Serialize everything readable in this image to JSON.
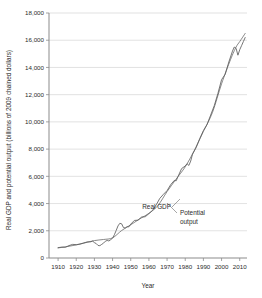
{
  "chart_data": {
    "type": "line",
    "title": "",
    "xlabel": "Year",
    "ylabel": "Real GDP and potential output (billions of 2009 chained dollars)",
    "xlim": [
      1905,
      2014
    ],
    "ylim": [
      0,
      18000
    ],
    "grid": true,
    "legend_position": "inline-annotations",
    "y_ticks": [
      0,
      2000,
      4000,
      6000,
      8000,
      10000,
      12000,
      14000,
      16000,
      18000
    ],
    "y_tick_labels": [
      "0",
      "2,000",
      "4,000",
      "6,000",
      "8,000",
      "10,000",
      "12,000",
      "14,000",
      "16,000",
      "18,000"
    ],
    "x_ticks": [
      1910,
      1920,
      1930,
      1940,
      1950,
      1960,
      1970,
      1980,
      1990,
      2000,
      2010
    ],
    "x_tick_labels": [
      "1910",
      "1920",
      "1930",
      "1940",
      "1950",
      "1960",
      "1970",
      "1980",
      "1990",
      "2000",
      "2010"
    ],
    "annotations": [
      {
        "label": "Real GDP",
        "x": 1963,
        "y": 4150
      },
      {
        "label": "Potential",
        "x": 1978,
        "y": 3450
      },
      {
        "label": "output",
        "x": 1978,
        "y": 2750
      }
    ],
    "series": [
      {
        "name": "Real GDP",
        "x": [
          1910,
          1912,
          1914,
          1916,
          1918,
          1920,
          1922,
          1924,
          1926,
          1928,
          1929,
          1930,
          1931,
          1932,
          1933,
          1934,
          1935,
          1936,
          1937,
          1938,
          1939,
          1940,
          1941,
          1942,
          1943,
          1944,
          1945,
          1946,
          1947,
          1948,
          1949,
          1950,
          1952,
          1954,
          1956,
          1958,
          1960,
          1962,
          1964,
          1966,
          1968,
          1970,
          1972,
          1974,
          1975,
          1976,
          1978,
          1980,
          1981,
          1982,
          1983,
          1984,
          1986,
          1988,
          1990,
          1992,
          1994,
          1996,
          1998,
          2000,
          2002,
          2004,
          2006,
          2007,
          2008,
          2009,
          2010,
          2011,
          2012,
          2013
        ],
        "values": [
          760,
          800,
          790,
          910,
          1000,
          980,
          1020,
          1100,
          1180,
          1190,
          1240,
          1130,
          1060,
          920,
          905,
          1000,
          1090,
          1230,
          1290,
          1250,
          1350,
          1460,
          1710,
          2030,
          2360,
          2550,
          2510,
          2230,
          2210,
          2300,
          2290,
          2490,
          2760,
          2780,
          3010,
          3030,
          3260,
          3500,
          3900,
          4380,
          4680,
          4950,
          5390,
          5700,
          5670,
          5980,
          6570,
          6760,
          6930,
          6800,
          7120,
          7630,
          8110,
          8780,
          9360,
          9800,
          10500,
          11200,
          12100,
          13100,
          13500,
          14400,
          15200,
          15500,
          15400,
          14900,
          15300,
          15600,
          15900,
          16200
        ]
      },
      {
        "name": "Potential output",
        "x": [
          1910,
          1915,
          1920,
          1925,
          1930,
          1935,
          1940,
          1945,
          1950,
          1955,
          1960,
          1965,
          1970,
          1975,
          1980,
          1985,
          1990,
          1995,
          2000,
          2005,
          2008,
          2010,
          2013
        ],
        "values": [
          740,
          840,
          960,
          1120,
          1280,
          1360,
          1480,
          2020,
          2440,
          2880,
          3280,
          3860,
          4880,
          5800,
          6700,
          7900,
          9300,
          10700,
          12800,
          14600,
          15500,
          15900,
          16500
        ]
      }
    ]
  },
  "axis": {
    "x_title": "Year",
    "y_title": "Real GDP and potential output (billions of 2009 chained dollars)"
  }
}
